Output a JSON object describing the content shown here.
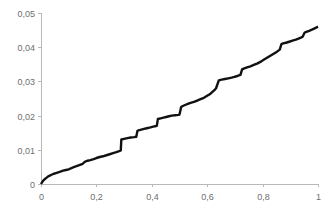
{
  "chart_data": {
    "type": "line",
    "title": "",
    "subtitle": "",
    "xlabel": "",
    "ylabel": "",
    "xlim": [
      0,
      1
    ],
    "ylim": [
      0,
      0.05
    ],
    "grid": false,
    "legend": false,
    "legend_position": "none",
    "line_color": "#111111",
    "axis_color": "#b8b8b8",
    "tick_label_color": "#6e6e6e",
    "decimal_separator": ",",
    "xticks": [
      0,
      0.2,
      0.4,
      0.6,
      0.8,
      1
    ],
    "xtick_labels": [
      "0",
      "0,2",
      "0,4",
      "0,6",
      "0,8",
      "1"
    ],
    "yticks": [
      0,
      0.01,
      0.02,
      0.03,
      0.04,
      0.05
    ],
    "ytick_labels": [
      "0",
      "0,01",
      "0,02",
      "0,03",
      "0,04",
      "0,05"
    ],
    "series": [
      {
        "name": "cumulative",
        "x": [
          0.0,
          0.006,
          0.012,
          0.018,
          0.024,
          0.03,
          0.038,
          0.046,
          0.054,
          0.062,
          0.07,
          0.08,
          0.09,
          0.1,
          0.108,
          0.118,
          0.128,
          0.138,
          0.148,
          0.152,
          0.158,
          0.168,
          0.178,
          0.19,
          0.2,
          0.212,
          0.224,
          0.236,
          0.248,
          0.26,
          0.272,
          0.282,
          0.288,
          0.29,
          0.3,
          0.312,
          0.324,
          0.336,
          0.344,
          0.348,
          0.352,
          0.362,
          0.372,
          0.382,
          0.392,
          0.402,
          0.412,
          0.418,
          0.422,
          0.432,
          0.442,
          0.452,
          0.462,
          0.472,
          0.484,
          0.496,
          0.5,
          0.506,
          0.512,
          0.52,
          0.53,
          0.54,
          0.552,
          0.564,
          0.576,
          0.588,
          0.6,
          0.612,
          0.62,
          0.628,
          0.632,
          0.642,
          0.652,
          0.664,
          0.676,
          0.688,
          0.698,
          0.706,
          0.712,
          0.72,
          0.726,
          0.734,
          0.744,
          0.756,
          0.768,
          0.78,
          0.792,
          0.804,
          0.816,
          0.828,
          0.84,
          0.852,
          0.862,
          0.868,
          0.874,
          0.884,
          0.896,
          0.908,
          0.92,
          0.932,
          0.944,
          0.952,
          0.958,
          0.968,
          0.98,
          0.99,
          1.0
        ],
        "y": [
          0.0,
          0.0008,
          0.0013,
          0.0017,
          0.0021,
          0.0024,
          0.0027,
          0.003,
          0.0032,
          0.0034,
          0.0036,
          0.0039,
          0.0041,
          0.0043,
          0.0046,
          0.0049,
          0.0052,
          0.0055,
          0.0058,
          0.006,
          0.0065,
          0.0068,
          0.007,
          0.0073,
          0.0076,
          0.0079,
          0.0081,
          0.0084,
          0.0087,
          0.009,
          0.0093,
          0.0096,
          0.0098,
          0.013,
          0.0132,
          0.0134,
          0.0136,
          0.0137,
          0.0138,
          0.0155,
          0.0157,
          0.0159,
          0.0161,
          0.0163,
          0.0165,
          0.0167,
          0.0169,
          0.017,
          0.019,
          0.0192,
          0.0194,
          0.0196,
          0.0198,
          0.02,
          0.0201,
          0.0202,
          0.0203,
          0.0225,
          0.0228,
          0.0231,
          0.0234,
          0.0237,
          0.024,
          0.0244,
          0.0248,
          0.0252,
          0.0258,
          0.0264,
          0.027,
          0.0276,
          0.028,
          0.0303,
          0.0305,
          0.0307,
          0.0309,
          0.0311,
          0.0313,
          0.0315,
          0.0317,
          0.0319,
          0.0335,
          0.0338,
          0.0341,
          0.0344,
          0.0348,
          0.0352,
          0.0357,
          0.0363,
          0.0369,
          0.0375,
          0.0381,
          0.0387,
          0.0393,
          0.0409,
          0.0411,
          0.0413,
          0.0416,
          0.0419,
          0.0422,
          0.0426,
          0.043,
          0.0443,
          0.0445,
          0.0448,
          0.0452,
          0.0456,
          0.046
        ]
      }
    ]
  },
  "layout": {
    "plot_left": 41,
    "plot_right": 318,
    "plot_top": 13,
    "plot_bottom": 184,
    "width": 329,
    "height": 212,
    "tick_length": 3,
    "x_label_offset": 13,
    "y_label_offset": 6
  }
}
